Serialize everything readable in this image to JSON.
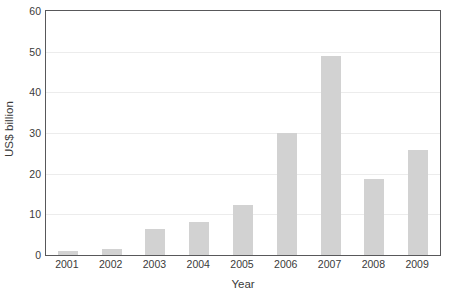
{
  "chart_data": {
    "type": "bar",
    "title": "",
    "subtitle": "",
    "xlabel": "Year",
    "ylabel": "US$ billion",
    "categories": [
      "2001",
      "2002",
      "2003",
      "2004",
      "2005",
      "2006",
      "2007",
      "2008",
      "2009"
    ],
    "values": [
      1.0,
      1.5,
      6.3,
      8.2,
      12.3,
      30.0,
      49.0,
      18.7,
      25.8
    ],
    "series": [
      {
        "name": "US$ billion",
        "values": [
          1.0,
          1.5,
          6.3,
          8.2,
          12.3,
          30.0,
          49.0,
          18.7,
          25.8
        ]
      }
    ],
    "ylim": [
      0,
      60
    ],
    "yticks": [
      0,
      10,
      20,
      30,
      40,
      50,
      60
    ],
    "ytick_labels": [
      "0",
      "10",
      "20",
      "30",
      "40",
      "50",
      "60"
    ],
    "grid": true,
    "grid_axis": "y",
    "legend": false,
    "legend_position": "none",
    "bar_color": "#d2d2d2",
    "axis_color": "#58585a",
    "gridline_color": "#ececec",
    "text_color": "#3a3a3a",
    "background_color": "#ffffff"
  }
}
